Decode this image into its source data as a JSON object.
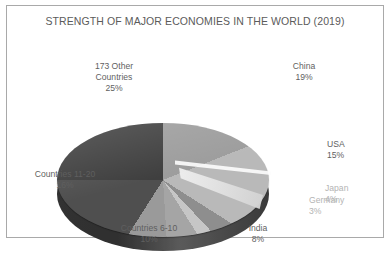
{
  "chart_data": {
    "type": "pie",
    "title": "STRENGTH OF MAJOR ECONOMIES IN THE WORLD (2019)",
    "xlabel": "",
    "ylabel": "",
    "legend": "none",
    "grid": false,
    "three_d": true,
    "exploded_slices": [
      "Japan",
      "Germany"
    ],
    "categories": [
      "China",
      "USA",
      "Japan",
      "Germany",
      "India",
      "Countries 6-10",
      "Countries 11-20",
      "173 Other Countries"
    ],
    "values": [
      19,
      15,
      4,
      3,
      8,
      10,
      16,
      25
    ],
    "unit": "%",
    "slices": [
      {
        "label": "China",
        "value": 19,
        "value_text": "19%",
        "color": "#9d9d9d"
      },
      {
        "label": "USA",
        "value": 15,
        "value_text": "15%",
        "color": "#b9b9b9"
      },
      {
        "label": "Japan",
        "value": 4,
        "value_text": "4%",
        "color": "#8e8e8e"
      },
      {
        "label": "Germany",
        "value": 3,
        "value_text": "3%",
        "color": "#c6c6c6"
      },
      {
        "label": "India",
        "value": 8,
        "value_text": "8%",
        "color": "#a5a5a5"
      },
      {
        "label": "Countries 6-10",
        "value": 10,
        "value_text": "10%",
        "color": "#9a9a9a"
      },
      {
        "label": "Countries 11-20",
        "value": 16,
        "value_text": "16%",
        "color": "#4f4f4f"
      },
      {
        "label": "173 Other Countries",
        "value": 25,
        "value_text": "25%",
        "color": "#3f3f3f"
      }
    ],
    "total": 100
  },
  "labels": {
    "other_countries": "173 Other\nCountries",
    "other_countries_pct": "25%",
    "china": "China",
    "china_pct": "19%",
    "usa": "USA",
    "usa_pct": "15%",
    "japan": "Japan",
    "japan_pct": "4%",
    "germany": "Germany",
    "germany_pct": "3%",
    "india": "India",
    "india_pct": "8%",
    "countries_11_20": "Countries 11-20",
    "countries_11_20_pct": "16%",
    "countries_6_10": "Countries 6-10",
    "countries_6_10_pct": "10%"
  },
  "colors": {
    "border": "#a9a9a9",
    "text": "#5f5f5f",
    "faint_text": "#b4b4b4",
    "background": "#ffffff"
  }
}
